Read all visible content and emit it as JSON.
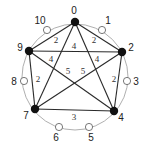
{
  "diagram": {
    "type": "weighted-graph",
    "ring": {
      "cx": 75,
      "cy": 77,
      "r": 53
    },
    "nodes": [
      {
        "id": "0",
        "label": "0",
        "kind": "filled",
        "x": 75,
        "y": 22,
        "lx": 74,
        "ly": 11
      },
      {
        "id": "1",
        "label": "1",
        "kind": "open",
        "x": 102,
        "y": 30,
        "lx": 108,
        "ly": 21
      },
      {
        "id": "2",
        "label": "2",
        "kind": "filled",
        "x": 122,
        "y": 52,
        "lx": 131,
        "ly": 48
      },
      {
        "id": "3",
        "label": "3",
        "kind": "open",
        "x": 127,
        "y": 81,
        "lx": 136,
        "ly": 82
      },
      {
        "id": "4",
        "label": "4",
        "kind": "filled",
        "x": 114,
        "y": 111,
        "lx": 121,
        "ly": 118
      },
      {
        "id": "5",
        "label": "5",
        "kind": "open",
        "x": 89,
        "y": 127,
        "lx": 91,
        "ly": 138
      },
      {
        "id": "6",
        "label": "6",
        "kind": "open",
        "x": 59,
        "y": 127,
        "lx": 56,
        "ly": 138
      },
      {
        "id": "7",
        "label": "7",
        "kind": "filled",
        "x": 35,
        "y": 109,
        "lx": 26,
        "ly": 116
      },
      {
        "id": "8",
        "label": "8",
        "kind": "open",
        "x": 24,
        "y": 81,
        "lx": 14,
        "ly": 82
      },
      {
        "id": "9",
        "label": "9",
        "kind": "filled",
        "x": 29,
        "y": 51,
        "lx": 20,
        "ly": 48
      },
      {
        "id": "10",
        "label": "10",
        "kind": "open",
        "x": 47,
        "y": 30,
        "lx": 40,
        "ly": 21
      }
    ],
    "edges": [
      {
        "from": "0",
        "to": "9",
        "weight": "2",
        "wx": 56,
        "wy": 41
      },
      {
        "from": "0",
        "to": "2",
        "weight": "2",
        "wx": 94,
        "wy": 41
      },
      {
        "from": "9",
        "to": "2",
        "weight": "4",
        "wx": 74,
        "wy": 47
      },
      {
        "from": "0",
        "to": "7",
        "weight": "4",
        "wx": 51,
        "wy": 60
      },
      {
        "from": "0",
        "to": "4",
        "weight": "4",
        "wx": 97,
        "wy": 60
      },
      {
        "from": "9",
        "to": "4",
        "weight": "5",
        "wx": 68,
        "wy": 72
      },
      {
        "from": "2",
        "to": "7",
        "weight": "5",
        "wx": 83,
        "wy": 72
      },
      {
        "from": "9",
        "to": "7",
        "weight": "2",
        "wx": 38,
        "wy": 80
      },
      {
        "from": "2",
        "to": "4",
        "weight": "2",
        "wx": 114,
        "wy": 80
      },
      {
        "from": "7",
        "to": "4",
        "weight": "3",
        "wx": 74,
        "wy": 118
      }
    ]
  }
}
